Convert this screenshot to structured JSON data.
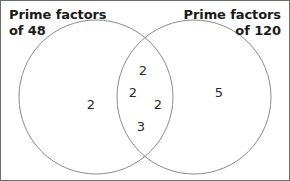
{
  "diagram": {
    "title_left": "Prime factors\nof 48",
    "title_right": "Prime factors\nof 120",
    "stroke_color": "#8a8a8a",
    "border_color": "#6b6b6b",
    "text_color": "#1a1a1a",
    "regions": {
      "left_only": [
        {
          "value": "2",
          "x": 90,
          "y": 103
        }
      ],
      "intersection": [
        {
          "value": "2",
          "x": 142,
          "y": 69
        },
        {
          "value": "2",
          "x": 132,
          "y": 91
        },
        {
          "value": "2",
          "x": 157,
          "y": 103
        },
        {
          "value": "3",
          "x": 140,
          "y": 125
        }
      ],
      "right_only": [
        {
          "value": "5",
          "x": 218,
          "y": 91
        }
      ]
    },
    "circles": {
      "left": {
        "cx": 95,
        "cy": 96,
        "r": 77
      },
      "right": {
        "cx": 193,
        "cy": 96,
        "r": 77
      }
    }
  }
}
